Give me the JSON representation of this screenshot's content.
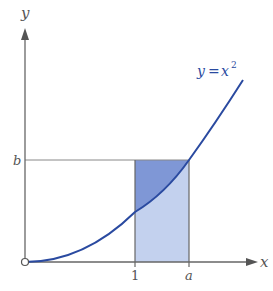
{
  "diagram": {
    "axes": {
      "x_label": "x",
      "y_label": "y"
    },
    "curve": {
      "label_y": "y",
      "label_eq": "=",
      "label_x": "x",
      "label_exp": "2",
      "color": "#2a4aa0"
    },
    "ticks": {
      "x_tick_1": "1",
      "x_tick_a": "a",
      "y_tick_b": "b"
    },
    "regions": {
      "upper_fill": "#7f97d6",
      "lower_fill": "#c3d1ee"
    },
    "axis_color": "#666666"
  }
}
